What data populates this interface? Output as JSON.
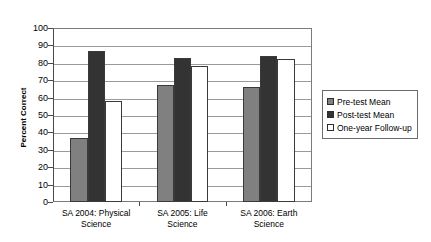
{
  "chart_data": {
    "type": "bar",
    "title": "",
    "subtitle": "",
    "xlabel": "",
    "ylabel": "Percent Correct",
    "ylim": [
      0,
      100
    ],
    "ytick_step": 10,
    "yticks": [
      0,
      10,
      20,
      30,
      40,
      50,
      60,
      70,
      80,
      90,
      100
    ],
    "ytick_labels": [
      "0",
      "10",
      "20",
      "30",
      "40",
      "50",
      "60",
      "70",
      "80",
      "90",
      "100"
    ],
    "grid": "horizontal",
    "legend_position": "right",
    "categories": [
      "SA 2004: Physical\nScience",
      "SA 2005: Life\nScience",
      "SA 2006: Earth\nScience"
    ],
    "series": [
      {
        "name": "Pre-test Mean",
        "color": "#808080",
        "values": [
          37,
          67,
          66
        ]
      },
      {
        "name": "Post-test Mean",
        "color": "#333333",
        "values": [
          87,
          83,
          84
        ]
      },
      {
        "name": "One-year Follow-up",
        "color": "#ffffff",
        "values": [
          58,
          78,
          82
        ]
      }
    ]
  },
  "legend": {
    "items": [
      {
        "label": "Pre-test Mean"
      },
      {
        "label": "Post-test Mean"
      },
      {
        "label": "One-year Follow-up"
      }
    ]
  }
}
